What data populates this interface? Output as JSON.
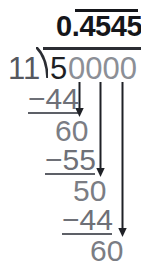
{
  "figure": {
    "type": "long-division",
    "background_color": "#ffffff"
  },
  "colors": {
    "quotient": "#15161a",
    "dividend_lead": "#1e1f24",
    "dividend_zeros": "#8c8f96",
    "divisor": "#55585f",
    "steps": "#6e7077",
    "rules": "#5d6067",
    "arrows": "#1f2126",
    "bracket": "#2b2d33"
  },
  "quotient": {
    "integer_part": "0.",
    "repeating_part": "4545",
    "full_text": "0.4545",
    "has_vinculum": true,
    "vinculum_over": "4545"
  },
  "divisor": {
    "value": "11"
  },
  "dividend": {
    "lead_digit": "5",
    "trailing_zeros": "0000",
    "full_text": "50000"
  },
  "steps": [
    {
      "name": "subtract-1",
      "text": "−44",
      "underlined": true
    },
    {
      "name": "remainder-1",
      "text": "60"
    },
    {
      "name": "subtract-2",
      "text": "−55",
      "underlined": true
    },
    {
      "name": "remainder-2",
      "text": "50"
    },
    {
      "name": "subtract-3",
      "text": "−44",
      "underlined": true
    },
    {
      "name": "remainder-3",
      "text": "60"
    }
  ],
  "bring_down_arrows": [
    {
      "name": "bring-down-arrow-1",
      "from_digit_index": 1,
      "to_step": "remainder-1"
    },
    {
      "name": "bring-down-arrow-2",
      "from_digit_index": 2,
      "to_step": "remainder-2"
    },
    {
      "name": "bring-down-arrow-3",
      "from_digit_index": 3,
      "to_step": "remainder-3"
    }
  ]
}
